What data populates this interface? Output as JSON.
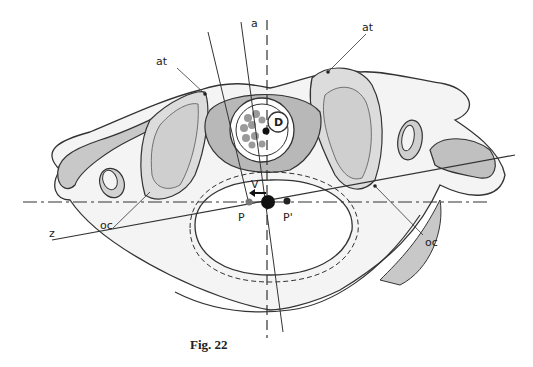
{
  "figure": {
    "caption": "Fig. 22",
    "labels": {
      "axis_a": "a",
      "atlas_left": "at",
      "atlas_right": "at",
      "dens": "D",
      "vector": "V",
      "point_p": "P",
      "point_p_prime": "P'",
      "axis_z": "z",
      "occipital_left": "oc",
      "occipital_right": "oc"
    },
    "colors": {
      "outline": "#333333",
      "fill_dark": "#bdbdbd",
      "fill_light": "#dedede",
      "fill_bone": "#f4f4f4",
      "point_p": "#777777",
      "point_center": "#111111"
    }
  }
}
